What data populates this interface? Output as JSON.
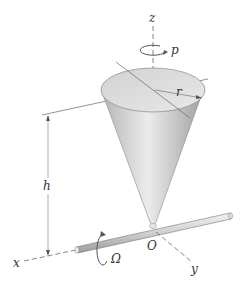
{
  "diagram": {
    "labels": {
      "z_axis": "z",
      "x_axis": "x",
      "y_axis": "y",
      "spin_rate": "p",
      "radius": "r",
      "height": "h",
      "precession_rate": "Ω",
      "origin": "O"
    },
    "colors": {
      "line": "#555555",
      "cone_light": "#e4e4e4",
      "cone_dark": "#a8a8a8",
      "rod": "#cfcfcf",
      "text": "#333333"
    }
  }
}
